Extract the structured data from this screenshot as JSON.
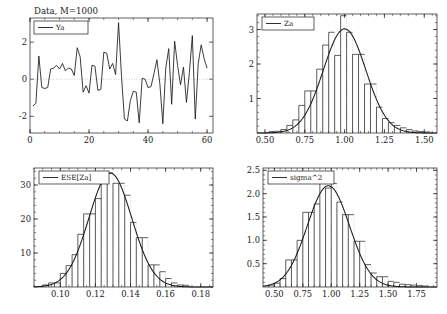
{
  "figure": {
    "panel_count": 4,
    "background": "#ffffff",
    "line_color": "#1a1a1a",
    "grid_color": "#b9b9b9"
  },
  "chart_data": [
    {
      "id": "data-series",
      "type": "line",
      "title": "Data, M=1000",
      "xlabel": "",
      "ylabel": "",
      "legend": [
        "Ya"
      ],
      "legend_position": "top-left",
      "grid": false,
      "zero_line": true,
      "xlim": [
        0,
        62
      ],
      "ylim": [
        -2.9,
        3.3
      ],
      "xticks": [
        "0",
        "20",
        "40",
        "60"
      ],
      "xtick_values": [
        0,
        20,
        40,
        60
      ],
      "yticks": [
        "2",
        "0",
        "-2"
      ],
      "ytick_values": [
        2,
        0,
        -2
      ],
      "series": [
        {
          "name": "Ya",
          "x": [
            1,
            2,
            3,
            4,
            5,
            6,
            7,
            8,
            9,
            10,
            11,
            12,
            13,
            14,
            15,
            16,
            17,
            18,
            19,
            20,
            21,
            22,
            23,
            24,
            25,
            26,
            27,
            28,
            29,
            30,
            31,
            32,
            33,
            34,
            35,
            36,
            37,
            38,
            39,
            40,
            41,
            42,
            43,
            44,
            45,
            46,
            47,
            48,
            49,
            50,
            51,
            52,
            53,
            54,
            55,
            56,
            57,
            58,
            59,
            60
          ],
          "values": [
            -1.45,
            -1.3,
            1.25,
            -0.45,
            -0.5,
            -0.45,
            0.55,
            0.6,
            0.75,
            0.55,
            0.85,
            0.45,
            0.6,
            0.55,
            0.2,
            1.7,
            1.2,
            -0.7,
            -0.35,
            -0.75,
            0.75,
            0.7,
            -0.6,
            -0.55,
            1.45,
            1.4,
            0.55,
            0.85,
            0.25,
            3.05,
            0.15,
            -2.15,
            -2.25,
            -1.15,
            -0.65,
            -0.7,
            -2.35,
            0.05,
            0.0,
            -0.45,
            -0.4,
            0.3,
            1.05,
            -0.25,
            -2.4,
            0.6,
            1.65,
            -1.35,
            2.05,
            0.75,
            -0.3,
            0.65,
            -1.25,
            0.35,
            2.35,
            -2.15,
            0.85,
            1.85,
            1.1,
            0.6
          ]
        }
      ]
    },
    {
      "id": "za-histogram",
      "type": "bar",
      "title": "",
      "xlabel": "",
      "ylabel": "",
      "legend": [
        "Za"
      ],
      "legend_position": "top-left",
      "grid": false,
      "xlim": [
        0.45,
        1.58
      ],
      "ylim": [
        0,
        3.45
      ],
      "xticks": [
        "0.50",
        "0.75",
        "1.00",
        "1.25",
        "1.50"
      ],
      "xtick_values": [
        0.5,
        0.75,
        1.0,
        1.25,
        1.5
      ],
      "yticks": [
        "1",
        "2",
        "3"
      ],
      "ytick_values": [
        1,
        2,
        3
      ],
      "bin_width": 0.0375,
      "bin_starts": [
        0.525,
        0.5625,
        0.6,
        0.6375,
        0.675,
        0.7125,
        0.75,
        0.7875,
        0.825,
        0.8625,
        0.9,
        0.9375,
        0.975,
        1.0125,
        1.05,
        1.0875,
        1.125,
        1.1625,
        1.2,
        1.2375,
        1.275,
        1.3125,
        1.35,
        1.3875,
        1.425,
        1.4625,
        1.5
      ],
      "values": [
        0.04,
        0.05,
        0.1,
        0.22,
        0.38,
        0.8,
        1.22,
        1.22,
        1.85,
        2.55,
        2.92,
        2.25,
        3.4,
        2.92,
        2.28,
        2.28,
        1.42,
        1.42,
        0.75,
        0.42,
        0.3,
        0.22,
        0.15,
        0.1,
        0.06,
        0.04,
        0.03
      ],
      "curve": {
        "name": "normal-density",
        "mean": 1.0,
        "peak": 3.02,
        "sigma": 0.133
      }
    },
    {
      "id": "ese-za-histogram",
      "type": "bar",
      "title": "",
      "xlabel": "",
      "ylabel": "",
      "legend": [
        "ESE[Za]"
      ],
      "legend_position": "top-left",
      "grid": false,
      "xlim": [
        0.085,
        0.187
      ],
      "ylim": [
        0,
        35
      ],
      "xticks": [
        "0.10",
        "0.12",
        "0.14",
        "0.16",
        "0.18"
      ],
      "xtick_values": [
        0.1,
        0.12,
        0.14,
        0.16,
        0.18
      ],
      "yticks": [
        "10",
        "20",
        "30"
      ],
      "ytick_values": [
        10,
        20,
        30
      ],
      "bin_width": 0.00333,
      "bin_starts": [
        0.09,
        0.0933,
        0.0967,
        0.1,
        0.1033,
        0.1067,
        0.11,
        0.1133,
        0.1167,
        0.12,
        0.1233,
        0.1267,
        0.13,
        0.1333,
        0.1367,
        0.14,
        0.1433,
        0.1467,
        0.15,
        0.1533,
        0.1567,
        0.16,
        0.1633,
        0.1667,
        0.17
      ],
      "values": [
        0.6,
        1.2,
        1.2,
        4.0,
        6.3,
        9.5,
        15.5,
        21.5,
        21.5,
        26.0,
        33.5,
        33.5,
        30.5,
        30.5,
        27.0,
        19.0,
        14.5,
        14.5,
        6.5,
        6.5,
        4.5,
        2.5,
        1.2,
        0.6,
        0.5
      ],
      "curve": {
        "name": "normal-density",
        "mean": 0.1285,
        "peak": 33.5,
        "sigma": 0.0122
      }
    },
    {
      "id": "sigma-squared-histogram",
      "type": "bar",
      "title": "",
      "xlabel": "",
      "ylabel": "",
      "legend": [
        "sigma^2"
      ],
      "legend_position": "top-left",
      "grid": false,
      "xlim": [
        0.4,
        1.93
      ],
      "ylim": [
        0,
        2.55
      ],
      "xticks": [
        "0.50",
        "0.75",
        "1.00",
        "1.25",
        "1.50",
        "1.75"
      ],
      "xtick_values": [
        0.5,
        0.75,
        1.0,
        1.25,
        1.5,
        1.75
      ],
      "yticks": [
        "0.5",
        "1.0",
        "1.5",
        "2.0",
        "2.5"
      ],
      "ytick_values": [
        0.5,
        1.0,
        1.5,
        2.0,
        2.5
      ],
      "bin_width": 0.05,
      "bin_starts": [
        0.45,
        0.5,
        0.55,
        0.6,
        0.65,
        0.7,
        0.75,
        0.8,
        0.85,
        0.9,
        0.95,
        1.0,
        1.05,
        1.1,
        1.15,
        1.2,
        1.25,
        1.3,
        1.35,
        1.4,
        1.45,
        1.5,
        1.55,
        1.6,
        1.65,
        1.7,
        1.75,
        1.8
      ],
      "values": [
        0.04,
        0.08,
        0.18,
        0.58,
        0.58,
        1.0,
        1.6,
        1.6,
        1.78,
        2.42,
        2.12,
        2.22,
        1.82,
        1.55,
        1.55,
        0.98,
        0.98,
        0.48,
        0.3,
        0.22,
        0.22,
        0.12,
        0.1,
        0.06,
        0.05,
        0.04,
        0.03,
        0.02
      ],
      "curve": {
        "name": "normal-density",
        "mean": 0.975,
        "peak": 2.17,
        "sigma": 0.185
      }
    }
  ]
}
